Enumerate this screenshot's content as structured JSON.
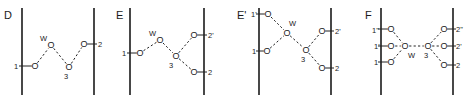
{
  "figure": {
    "panels": [
      {
        "id": "D",
        "letter": "D",
        "letter_pos": [
          4,
          19
        ],
        "walls": [
          {
            "x": 22,
            "y1": 8,
            "y2": 95
          },
          {
            "x": 94,
            "y1": 8,
            "y2": 95
          }
        ],
        "nodes": [
          {
            "key": "1",
            "atom": "O",
            "x": 35,
            "y": 66,
            "label": "1",
            "label_pos": [
              14,
              69
            ],
            "anchor_x": 22
          },
          {
            "key": "W",
            "atom": "O",
            "x": 51,
            "y": 45,
            "label": "W",
            "label_pos": [
              40,
              41
            ],
            "anchor_x": null
          },
          {
            "key": "3",
            "atom": "O",
            "x": 69,
            "y": 67,
            "label": "3",
            "label_pos": [
              64,
              79
            ],
            "anchor_x": null
          },
          {
            "key": "2",
            "atom": "O",
            "x": 84,
            "y": 44,
            "label": "2",
            "label_pos": [
              98,
              47
            ],
            "anchor_x": 94
          }
        ],
        "hbonds": [
          [
            "1",
            "W"
          ],
          [
            "W",
            "3"
          ],
          [
            "3",
            "2"
          ]
        ]
      },
      {
        "id": "E",
        "letter": "E",
        "letter_pos": [
          116,
          19
        ],
        "walls": [
          {
            "x": 130,
            "y1": 8,
            "y2": 95
          },
          {
            "x": 204,
            "y1": 8,
            "y2": 95
          }
        ],
        "nodes": [
          {
            "key": "1",
            "atom": "O",
            "x": 140,
            "y": 53,
            "label": "1",
            "label_pos": [
              122,
              56
            ],
            "anchor_x": 130
          },
          {
            "key": "W",
            "atom": "O",
            "x": 160,
            "y": 40,
            "label": "W",
            "label_pos": [
              149,
              36
            ],
            "anchor_x": null
          },
          {
            "key": "3",
            "atom": "O",
            "x": 176,
            "y": 56,
            "label": "3",
            "label_pos": [
              169,
              68
            ],
            "anchor_x": null
          },
          {
            "key": "2'",
            "atom": "O",
            "x": 194,
            "y": 35,
            "label": "2'",
            "label_pos": [
              208,
              38
            ],
            "anchor_x": 204
          },
          {
            "key": "2",
            "atom": "O",
            "x": 194,
            "y": 72,
            "label": "2",
            "label_pos": [
              208,
              75
            ],
            "anchor_x": 204
          }
        ],
        "hbonds": [
          [
            "1",
            "W"
          ],
          [
            "W",
            "3"
          ],
          [
            "3",
            "2'"
          ],
          [
            "3",
            "2"
          ]
        ]
      },
      {
        "id": "E'",
        "letter": "E'",
        "letter_pos": [
          237,
          19
        ],
        "walls": [
          {
            "x": 259,
            "y1": 8,
            "y2": 95
          },
          {
            "x": 331,
            "y1": 8,
            "y2": 95
          }
        ],
        "nodes": [
          {
            "key": "1'",
            "atom": "O",
            "x": 268,
            "y": 14,
            "label": "1'",
            "label_pos": [
              251,
              17
            ],
            "anchor_x": 259
          },
          {
            "key": "W",
            "atom": "O",
            "x": 287,
            "y": 33,
            "label": "W",
            "label_pos": [
              289,
              26
            ],
            "anchor_x": null
          },
          {
            "key": "1",
            "atom": "O",
            "x": 267,
            "y": 51,
            "label": "1",
            "label_pos": [
              252,
              54
            ],
            "anchor_x": 259
          },
          {
            "key": "3",
            "atom": "O",
            "x": 306,
            "y": 50,
            "label": "3",
            "label_pos": [
              301,
              62
            ],
            "anchor_x": null
          },
          {
            "key": "2'",
            "atom": "O",
            "x": 322,
            "y": 31,
            "label": "2'",
            "label_pos": [
              335,
              34
            ],
            "anchor_x": 331
          },
          {
            "key": "2",
            "atom": "O",
            "x": 322,
            "y": 68,
            "label": "2",
            "label_pos": [
              335,
              71
            ],
            "anchor_x": 331
          }
        ],
        "hbonds": [
          [
            "1'",
            "W"
          ],
          [
            "1",
            "W"
          ],
          [
            "W",
            "3"
          ],
          [
            "3",
            "2'"
          ],
          [
            "3",
            "2"
          ]
        ]
      },
      {
        "id": "F",
        "letter": "F",
        "letter_pos": [
          365,
          19
        ],
        "walls": [
          {
            "x": 381,
            "y1": 8,
            "y2": 95
          },
          {
            "x": 453,
            "y1": 8,
            "y2": 95
          }
        ],
        "nodes": [
          {
            "key": "1''",
            "atom": "O",
            "x": 391,
            "y": 29,
            "label": "1''",
            "label_pos": [
              372,
              33
            ],
            "anchor_x": 381
          },
          {
            "key": "1'",
            "atom": "O",
            "x": 391,
            "y": 46,
            "label": "1'",
            "label_pos": [
              374,
              49
            ],
            "anchor_x": 381
          },
          {
            "key": "1",
            "atom": "O",
            "x": 391,
            "y": 62,
            "label": "1",
            "label_pos": [
              374,
              65
            ],
            "anchor_x": 381
          },
          {
            "key": "W",
            "atom": "O",
            "x": 405,
            "y": 46,
            "label": "W",
            "label_pos": [
              408,
              58
            ],
            "anchor_x": null
          },
          {
            "key": "3",
            "atom": "O",
            "x": 428,
            "y": 46,
            "label": "3",
            "label_pos": [
              424,
              58
            ],
            "anchor_x": null
          },
          {
            "key": "2''",
            "atom": "O",
            "x": 444,
            "y": 29,
            "label": "2''",
            "label_pos": [
              456,
              32
            ],
            "anchor_x": 453
          },
          {
            "key": "2'",
            "atom": "O",
            "x": 444,
            "y": 46,
            "label": "2'",
            "label_pos": [
              456,
              49
            ],
            "anchor_x": 453
          },
          {
            "key": "2",
            "atom": "O",
            "x": 444,
            "y": 65,
            "label": "2",
            "label_pos": [
              456,
              68
            ],
            "anchor_x": 453
          }
        ],
        "hbonds": [
          [
            "1''",
            "W"
          ],
          [
            "1'",
            "W"
          ],
          [
            "1",
            "W"
          ],
          [
            "W",
            "3"
          ],
          [
            "3",
            "2''"
          ],
          [
            "3",
            "2'"
          ],
          [
            "3",
            "2"
          ]
        ]
      }
    ]
  },
  "colors": {
    "ink": "#1a1a1a",
    "background": "#ffffff"
  }
}
